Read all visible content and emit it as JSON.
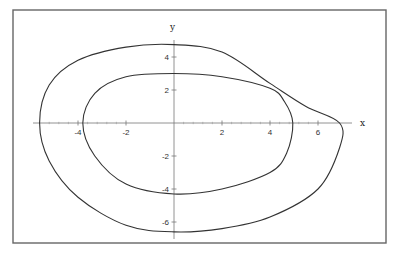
{
  "chart_data": {
    "type": "line",
    "title": "",
    "xlabel": "x",
    "ylabel": "y",
    "xlim": [
      -6.0,
      7.5
    ],
    "ylim": [
      -7.0,
      5.5
    ],
    "grid": false,
    "legend": null,
    "x_ticks": [
      -4,
      -2,
      2,
      4,
      6
    ],
    "y_ticks": [
      -6,
      -4,
      -2,
      2,
      4
    ],
    "x_tick_labels": [
      "-4",
      "-2",
      "2",
      "4",
      "6"
    ],
    "y_tick_labels": [
      "-6",
      "-4",
      "-2",
      "2",
      "4"
    ],
    "series": [
      {
        "name": "outer closed curve",
        "closed": true,
        "points": [
          [
            -5.6,
            0
          ],
          [
            -5.2,
            2.3
          ],
          [
            -4,
            3.8
          ],
          [
            -2,
            4.6
          ],
          [
            0,
            4.75
          ],
          [
            2,
            4.3
          ],
          [
            4,
            2.4
          ],
          [
            5.5,
            1.0
          ],
          [
            6.9,
            0
          ],
          [
            6.9,
            -1.5
          ],
          [
            6,
            -4
          ],
          [
            4,
            -5.7
          ],
          [
            2,
            -6.4
          ],
          [
            0,
            -6.6
          ],
          [
            -2,
            -6.2
          ],
          [
            -4,
            -4.5
          ],
          [
            -5.2,
            -2.3
          ]
        ]
      },
      {
        "name": "inner closed curve",
        "closed": true,
        "points": [
          [
            -3.8,
            0
          ],
          [
            -3.3,
            1.8
          ],
          [
            -2,
            2.8
          ],
          [
            0,
            3.0
          ],
          [
            2,
            2.8
          ],
          [
            4,
            2.1
          ],
          [
            4.6,
            1.3
          ],
          [
            4.95,
            0
          ],
          [
            4.7,
            -1.8
          ],
          [
            4,
            -3.0
          ],
          [
            2,
            -4.0
          ],
          [
            0,
            -4.3
          ],
          [
            -2,
            -3.7
          ],
          [
            -3.3,
            -2.0
          ]
        ]
      }
    ],
    "annotations": [
      {
        "text": "intersection",
        "x": 4.1,
        "y": 2.1
      }
    ]
  },
  "axes": {
    "x_label": "x",
    "y_label": "y",
    "x_ticks": [
      {
        "value": -4,
        "label": "-4"
      },
      {
        "value": -2,
        "label": "-2"
      },
      {
        "value": 2,
        "label": "2"
      },
      {
        "value": 4,
        "label": "4"
      },
      {
        "value": 6,
        "label": "6"
      }
    ],
    "y_ticks": [
      {
        "value": 4,
        "label": "4"
      },
      {
        "value": 2,
        "label": "2"
      },
      {
        "value": -2,
        "label": "-2"
      },
      {
        "value": -4,
        "label": "-4"
      },
      {
        "value": -6,
        "label": "-6"
      }
    ]
  },
  "colors": {
    "curve": "#333333",
    "axis": "#777777",
    "frame": "#666666",
    "background": "#ffffff"
  }
}
